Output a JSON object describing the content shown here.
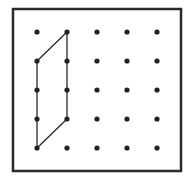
{
  "geoboard": {
    "frame": {
      "x": 13,
      "y": 9,
      "width": 168,
      "height": 162,
      "stroke": "#2a2a2a",
      "stroke_width": 2.5
    },
    "grid": {
      "columns": 5,
      "rows": 5,
      "x_positions": [
        37,
        67,
        97,
        127,
        157
      ],
      "y_positions": [
        32,
        61,
        90,
        119,
        148
      ],
      "dot_radius": 2.6,
      "dot_color": "#222222"
    },
    "shape": {
      "type": "parallelogram",
      "vertices_grid": [
        [
          1,
          0
        ],
        [
          0,
          1
        ],
        [
          0,
          4
        ],
        [
          1,
          3
        ]
      ],
      "stroke": "#2a2a2a",
      "stroke_width": 1.3
    }
  }
}
